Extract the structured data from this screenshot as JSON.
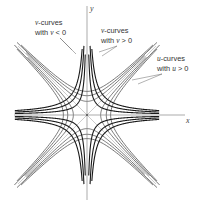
{
  "diagram": {
    "axes": {
      "x_label": "x",
      "y_label": "y"
    },
    "annotations": [
      {
        "id": "v-neg",
        "line1": "v-curves",
        "line2_prefix": "with ",
        "variable": "v",
        "relation": " < 0"
      },
      {
        "id": "v-pos",
        "line1": "v-curves",
        "line2_prefix": "with ",
        "variable": "v",
        "relation": " > 0"
      },
      {
        "id": "u-pos",
        "line1": "u-curves",
        "line2_prefix": "with ",
        "variable": "u",
        "relation": " > 0"
      }
    ],
    "families": {
      "u_curves": {
        "equation": "x^2 - y^2 = u",
        "values": [
          -3,
          -2,
          -1,
          1,
          2,
          3
        ],
        "color": "#555555"
      },
      "v_curves": {
        "equation": "2xy = v",
        "values": [
          -3,
          -2,
          -1,
          1,
          2,
          3
        ],
        "color": "#1a1a1a"
      },
      "asymptotes": {
        "equation": "y = ±x",
        "color": "#aaaaaa"
      }
    }
  }
}
